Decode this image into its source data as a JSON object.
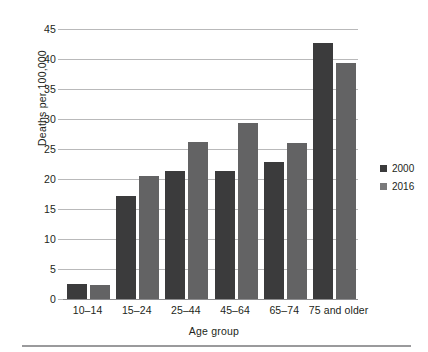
{
  "chart_data": {
    "type": "bar",
    "title": "",
    "subtitle": "",
    "xlabel": "Age group",
    "ylabel": "Deaths per 100,000",
    "categories": [
      "10–14",
      "15–24",
      "25–44",
      "45–64",
      "65–74",
      "75 and older"
    ],
    "series": [
      {
        "name": "2000",
        "color": "#3b3b3c",
        "values": [
          2.5,
          17.2,
          21.4,
          21.4,
          22.8,
          42.6
        ]
      },
      {
        "name": "2016",
        "color": "#636364",
        "values": [
          2.4,
          20.5,
          26.2,
          29.3,
          26.0,
          39.3
        ]
      }
    ],
    "ylim": [
      0,
      45
    ],
    "ytick_values": [
      0,
      5,
      10,
      15,
      20,
      25,
      30,
      35,
      40,
      45
    ],
    "ytick_labels": [
      "0",
      "5",
      "10",
      "15",
      "20",
      "25",
      "30",
      "35",
      "40",
      "45"
    ],
    "grid": true,
    "grid_axis": "y",
    "legend_position": "right",
    "bar_group_gap": true
  },
  "legend": {
    "entries": [
      {
        "label": "2000",
        "swatch": "legend-swatch-2000"
      },
      {
        "label": "2016",
        "swatch": "legend-swatch-2016"
      }
    ]
  },
  "colors": {
    "series_2000": "#3b3b3c",
    "series_2016": "#636364",
    "gridline": "#b9b9ba",
    "baseline": "#8d8d8f",
    "text": "#231f20",
    "footer_rule": "#9a9a9c",
    "background": "#ffffff"
  }
}
